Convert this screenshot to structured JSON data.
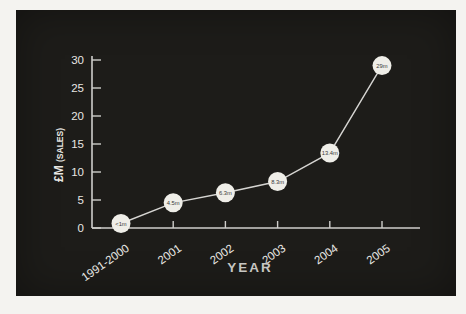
{
  "page": {
    "background": "#f4f3f0",
    "panel_background": "#1d1c19"
  },
  "chart_data": {
    "type": "line",
    "title": "",
    "xlabel": "YEAR",
    "ylabel": "£M (SALES)",
    "ylabel_main": "£M",
    "ylabel_sub": "(SALES)",
    "categories": [
      "1991-2000",
      "2001",
      "2002",
      "2003",
      "2004",
      "2005"
    ],
    "values": [
      0.8,
      4.5,
      6.3,
      8.3,
      13.4,
      29
    ],
    "point_labels": [
      "<1m",
      "4.5m",
      "6.3m",
      "8.3m",
      "13.4m",
      "29m"
    ],
    "y_ticks": [
      0,
      5,
      10,
      15,
      20,
      25,
      30
    ],
    "ylim": [
      0,
      30
    ],
    "grid": false,
    "legend": false,
    "colors": {
      "line": "#d6d5d2",
      "axis": "#cfcecb",
      "tick_label": "#e8e7e3",
      "marker_fill": "#efeee8",
      "marker_text": "#3a3a38",
      "xlabel_color": "#c7c6c2",
      "ylabel_color": "#e8e7e3"
    }
  }
}
